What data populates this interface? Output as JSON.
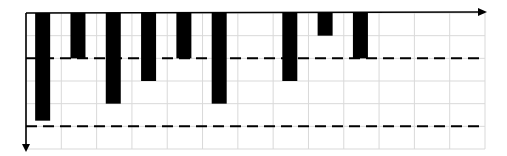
{
  "chart_data": {
    "type": "bar",
    "title": "",
    "xlabel": "",
    "ylabel": "",
    "orientation": "downward (bars hang from top axis)",
    "categories": [
      "1",
      "2",
      "3",
      "4",
      "5",
      "6",
      "7",
      "8",
      "9",
      "10",
      "11",
      "12",
      "13"
    ],
    "values": [
      4.75,
      2,
      4,
      3,
      2,
      4,
      null,
      3,
      1,
      2,
      null,
      null,
      null
    ],
    "ylim": [
      0,
      6
    ],
    "grid": true,
    "grid_columns": 13,
    "grid_rows": 6,
    "reference_lines": [
      {
        "value": 2,
        "style": "dashed"
      },
      {
        "value": 5,
        "style": "dashed"
      }
    ],
    "colors": {
      "bar": "#000000",
      "grid": "#d9d9d9",
      "axis": "#000000",
      "reference_line": "#000000"
    }
  }
}
